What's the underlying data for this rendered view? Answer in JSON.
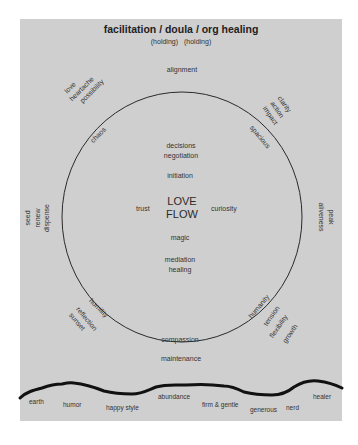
{
  "title": "facilitation / doula / org healing",
  "subtitle": [
    "(holding)",
    "(holding)"
  ],
  "colors": {
    "panel": "#cfcfcf",
    "ink": "#222222"
  },
  "circle": {
    "outer_top": "alignment",
    "outer_bottom": "maintenance",
    "top_left_outer": [
      "love",
      "heartache",
      "possibility"
    ],
    "top_left_on_arc": "chaos",
    "top_right_outer": [
      "clarity",
      "action",
      "impact"
    ],
    "top_right_on_arc": "spacious",
    "left_outer": [
      "seed",
      "renew",
      "dispense"
    ],
    "right_outer": [
      "peak",
      "aliveness"
    ],
    "bottom_left_outer": [
      "reflection",
      "sunset"
    ],
    "bottom_left_on_arc": "humility",
    "bottom_right_outer": [
      "tension",
      "flexibility",
      "growth"
    ],
    "bottom_right_on_arc": "humanity",
    "bottom_on_arc": "compassion"
  },
  "inner": {
    "top": [
      "decisions",
      "negotiation"
    ],
    "initiation": "initiation",
    "left": "trust",
    "right": "curiosity",
    "center": [
      "LOVE",
      "FLOW"
    ],
    "magic": "magic",
    "bottom": [
      "mediation",
      "healing"
    ]
  },
  "ground": {
    "labels": [
      "earth",
      "humor",
      "happy style",
      "abundance",
      "firm & gentle",
      "generous",
      "nerd",
      "healer"
    ]
  }
}
